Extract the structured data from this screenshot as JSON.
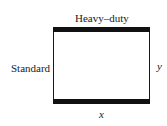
{
  "diagram": {
    "labels": {
      "top": "Heavy–duty",
      "left": "Standard",
      "right": "y",
      "bottom": "x"
    },
    "colors": {
      "line": "#1a1a1a",
      "thick_bar": "#111111",
      "background": "#ffffff"
    }
  }
}
